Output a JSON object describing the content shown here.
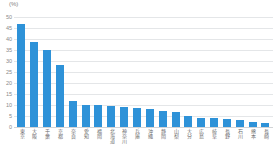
{
  "chart_data": {
    "type": "bar",
    "title": "",
    "subtitle": "",
    "xlabel": "",
    "ylabel": "",
    "unit_label": "(%)",
    "ylim": [
      0,
      50
    ],
    "yticks": [
      50,
      45,
      40,
      35,
      30,
      25,
      20,
      15,
      10,
      5,
      0
    ],
    "grid": true,
    "legend": "none",
    "bar_color": "#2e92d8",
    "gridline_color": "#e4e6e8",
    "axis_text_color": "#8a8a8a",
    "categories": [
      "東京",
      "大阪",
      "千葉",
      "京都",
      "奈良",
      "愛知",
      "福岡",
      "北海道",
      "神奈川",
      "兵庫",
      "沖縄",
      "静岡",
      "山梨",
      "大分",
      "広島",
      "岐阜",
      "長野",
      "石川",
      "熊本",
      "長崎"
    ],
    "values": [
      47,
      38.5,
      35,
      28,
      12,
      10,
      10,
      9.5,
      9,
      8.5,
      8,
      7.5,
      7,
      5,
      4,
      4,
      3.5,
      3,
      2.5,
      2
    ]
  }
}
